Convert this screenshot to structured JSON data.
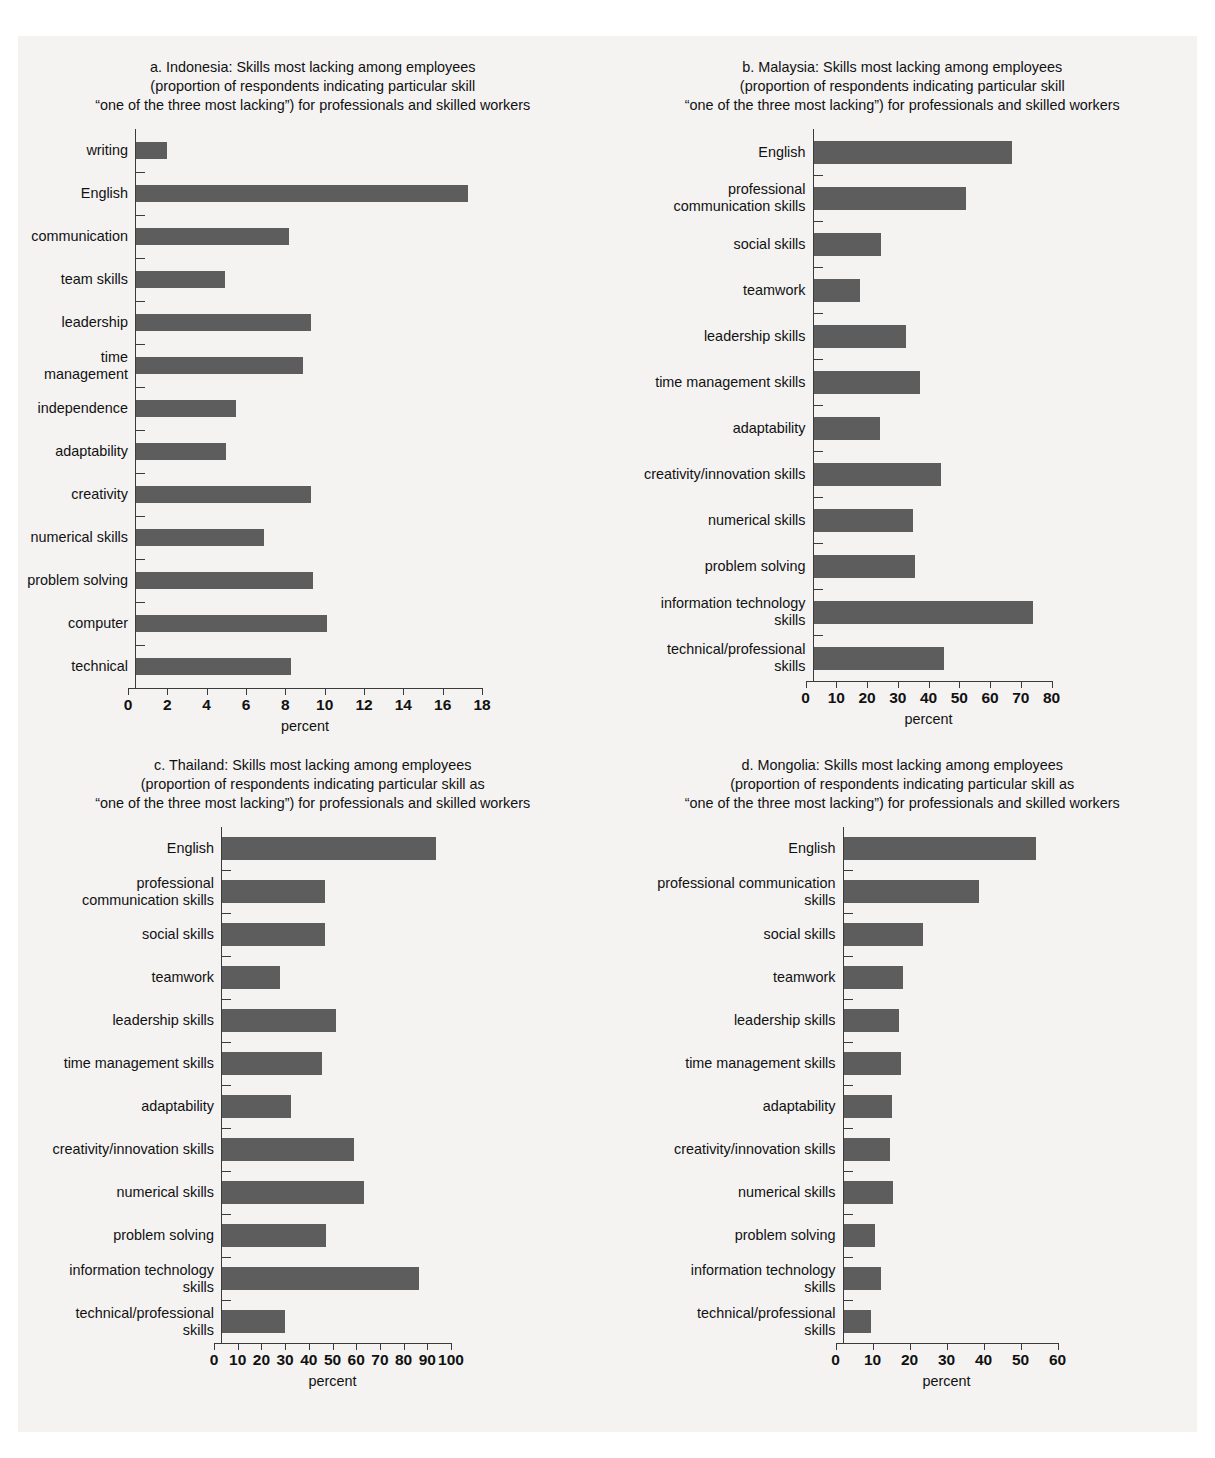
{
  "page": {
    "cropped_header_text": "....",
    "bar_color": "#5d5d5d",
    "background_color": "#f4f3f1",
    "axis_color": "#3a3a3a"
  },
  "chart_data": [
    {
      "id": "indonesia",
      "type": "bar",
      "orientation": "horizontal",
      "panel_label": "a.",
      "title_line1": "a. Indonesia: Skills most lacking among employees",
      "title_line2": "(proportion of respondents indicating particular skill",
      "title_line3": "“one of the three most lacking”) for professionals and skilled workers",
      "xlabel": "percent",
      "ylabel": "",
      "xlim": [
        0,
        18
      ],
      "xticks": [
        0,
        2,
        4,
        6,
        8,
        10,
        12,
        14,
        16,
        18
      ],
      "xticklabels": [
        "0",
        "2",
        "4",
        "6",
        "8",
        "10",
        "12",
        "14",
        "16",
        "18"
      ],
      "grid": false,
      "legend": "none",
      "categories": [
        "writing",
        "English",
        "communication",
        "team skills",
        "leadership",
        "time management",
        "independence",
        "adaptability",
        "creativity",
        "numerical skills",
        "problem solving",
        "computer",
        "technical"
      ],
      "values": [
        1.6,
        16.9,
        7.8,
        4.5,
        8.9,
        8.5,
        5.1,
        4.6,
        8.9,
        6.5,
        9.0,
        9.7,
        7.9
      ]
    },
    {
      "id": "malaysia",
      "type": "bar",
      "orientation": "horizontal",
      "panel_label": "b.",
      "title_line1": "b. Malaysia: Skills most lacking among employees",
      "title_line2": "(proportion of respondents indicating particular skill",
      "title_line3": "“one of the three most lacking”) for professionals and skilled workers",
      "xlabel": "percent",
      "ylabel": "",
      "xlim": [
        0,
        80
      ],
      "xticks": [
        0,
        10,
        20,
        30,
        40,
        50,
        60,
        70,
        80
      ],
      "xticklabels": [
        "0",
        "10",
        "20",
        "30",
        "40",
        "50",
        "60",
        "70",
        "80"
      ],
      "grid": false,
      "legend": "none",
      "categories": [
        "English",
        "professional\ncommunication skills",
        "social skills",
        "teamwork",
        "leadership skills",
        "time management  skills",
        "adaptability",
        "creativity/innovation skills",
        "numerical skills",
        "problem solving",
        "information technology\nskills",
        "technical/professional\nskills"
      ],
      "values": [
        64.5,
        49.5,
        22.0,
        15.0,
        30.0,
        34.5,
        21.5,
        41.5,
        32.5,
        33.0,
        71.5,
        42.5
      ]
    },
    {
      "id": "thailand",
      "type": "bar",
      "orientation": "horizontal",
      "panel_label": "c.",
      "title_line1": "c. Thailand: Skills most lacking among employees",
      "title_line2": "(proportion of respondents indicating particular skill as",
      "title_line3": "“one of the three most lacking”) for professionals and skilled workers",
      "xlabel": "percent",
      "ylabel": "",
      "xlim": [
        0,
        100
      ],
      "xticks": [
        0,
        10,
        20,
        30,
        40,
        50,
        60,
        70,
        80,
        90,
        100
      ],
      "xticklabels": [
        "0",
        "10",
        "20",
        "30",
        "40",
        "50",
        "60",
        "70",
        "80",
        "90",
        "100"
      ],
      "grid": false,
      "legend": "none",
      "categories": [
        "English",
        "professional\ncommunication skills",
        "social skills",
        "teamwork",
        "leadership skills",
        "time management  skills",
        "adaptability",
        "creativity/innovation skills",
        "numerical skills",
        "problem solving",
        "information technology\nskills",
        "technical/professional\nskills"
      ],
      "values": [
        90.5,
        43.5,
        43.5,
        24.5,
        48.0,
        42.0,
        29.0,
        55.5,
        60.0,
        44.0,
        83.0,
        26.5
      ]
    },
    {
      "id": "mongolia",
      "type": "bar",
      "orientation": "horizontal",
      "panel_label": "d.",
      "title_line1": "d. Mongolia: Skills most lacking among employees",
      "title_line2": "(proportion of respondents indicating particular skill as",
      "title_line3": "“one of the three most lacking”) for professionals and skilled workers",
      "xlabel": "percent",
      "ylabel": "",
      "xlim": [
        0,
        60
      ],
      "xticks": [
        0,
        10,
        20,
        30,
        40,
        50,
        60
      ],
      "xticklabels": [
        "0",
        "10",
        "20",
        "30",
        "40",
        "50",
        "60"
      ],
      "grid": false,
      "legend": "none",
      "categories": [
        "English",
        "professional communication\nskills",
        "social skills",
        "teamwork",
        "leadership skills",
        "time management skills",
        "adaptability",
        "creativity/innovation skills",
        "numerical skills",
        "problem solving",
        "information technology\nskills",
        "technical/professional\nskills"
      ],
      "values": [
        52.0,
        36.5,
        21.5,
        16.0,
        15.0,
        15.5,
        13.0,
        12.5,
        13.5,
        8.5,
        10.0,
        7.5
      ]
    }
  ]
}
